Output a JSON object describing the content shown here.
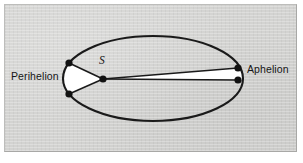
{
  "figure": {
    "type": "orbital-diagram",
    "background_color": "#d3d3d1",
    "ink_color": "#151515",
    "sector_fill_color": "#ffffff"
  },
  "labels": {
    "perihelion": "Perihelion",
    "aphelion": "Aphelion",
    "sun_focus": "S"
  },
  "geometry": {
    "ellipse": {
      "center_x": 153,
      "center_y": 78.5,
      "radius_x": 90,
      "radius_y": 42.5,
      "stroke_width": 2.1
    },
    "focus_sun": {
      "x": 103,
      "y": 79
    },
    "perihelion_vertex": {
      "x": 63,
      "y": 78.5
    },
    "aphelion_vertex": {
      "x": 243,
      "y": 78.5
    },
    "markers": [
      {
        "name": "perihelion-upper-point",
        "x": 69,
        "y": 63
      },
      {
        "name": "perihelion-lower-point",
        "x": 69,
        "y": 94
      },
      {
        "name": "sun-focus-point",
        "x": 103,
        "y": 79
      },
      {
        "name": "aphelion-upper-point",
        "x": 238,
        "y": 68
      },
      {
        "name": "aphelion-lower-point",
        "x": 238,
        "y": 80
      }
    ],
    "marker_radius": 3.4,
    "swept_sectors": [
      {
        "name": "perihelion-sector",
        "description": "Wide white sector swept near perihelion",
        "vertices": [
          "sun-focus-point",
          "perihelion-upper-point",
          "perihelion-vertex",
          "perihelion-lower-point"
        ]
      },
      {
        "name": "aphelion-sector",
        "description": "Thin white sector swept near aphelion, equal in area",
        "vertices": [
          "sun-focus-point",
          "aphelion-upper-point",
          "aphelion-vertex",
          "aphelion-lower-point"
        ]
      }
    ]
  }
}
